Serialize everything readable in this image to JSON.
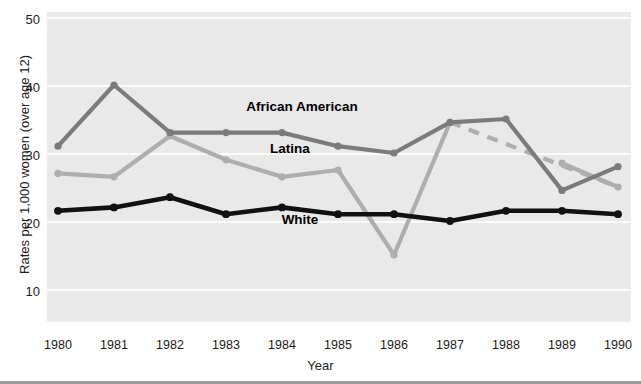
{
  "chart_data": {
    "type": "line",
    "title": "",
    "xlabel": "Year",
    "ylabel": "Rates per 1,000 women (over age 12)",
    "categories": [
      "1980",
      "1981",
      "1982",
      "1983",
      "1984",
      "1985",
      "1986",
      "1987",
      "1988",
      "1989",
      "1990"
    ],
    "x": [
      1980,
      1981,
      1982,
      1983,
      1984,
      1985,
      1986,
      1987,
      1988,
      1989,
      1990
    ],
    "ylim": [
      5,
      50
    ],
    "xlim": [
      1980,
      1990
    ],
    "y_ticks": [
      10,
      20,
      30,
      40,
      50
    ],
    "y_tick_labels": [
      "10",
      "20",
      "30",
      "40",
      "50"
    ],
    "x_ticks": [
      1980,
      1981,
      1982,
      1983,
      1984,
      1985,
      1986,
      1987,
      1988,
      1989,
      1990
    ],
    "grid": "horizontal white gridlines on gray panel",
    "legend_position": "inline labels on plot",
    "series": [
      {
        "name": "African American",
        "color": "#7b7b7b",
        "linestyle": "solid",
        "marker": "circle",
        "values": [
          31,
          40,
          33,
          33,
          33,
          31,
          30,
          34.5,
          35,
          24.5,
          28
        ]
      },
      {
        "name": "Latina",
        "color": "#aeaeae",
        "linestyle": "solid with dashed segment 1987-1990",
        "marker": "circle",
        "values": [
          27,
          26.5,
          32.5,
          29,
          26.5,
          27.5,
          15,
          34.5,
          null,
          28.5,
          25
        ],
        "dashed_segment": {
          "from_year": 1987,
          "from_value": 34.5,
          "to_year": 1990,
          "to_value": 25
        }
      },
      {
        "name": "White",
        "color": "#111111",
        "linestyle": "solid",
        "marker": "circle",
        "values": [
          21.5,
          22,
          23.5,
          21,
          22,
          21,
          21,
          20,
          21.5,
          21.5,
          21
        ]
      }
    ],
    "annotations": [
      {
        "text": "African American",
        "year": 1984,
        "value": 37.5
      },
      {
        "text": "Latina",
        "year": 1984,
        "value": 31.4
      },
      {
        "text": "White",
        "year": 1984,
        "value": 21.0
      }
    ]
  },
  "axes": {
    "y_title": "Rates per 1,000 women (over age 12)",
    "x_title": "Year",
    "y_tick_labels": [
      "50",
      "40",
      "30",
      "20",
      "10"
    ],
    "x_tick_labels": [
      "1980",
      "1981",
      "1982",
      "1983",
      "1984",
      "1985",
      "1986",
      "1987",
      "1988",
      "1989",
      "1990"
    ]
  },
  "labels": {
    "african_american": "African American",
    "latina": "Latina",
    "white": "White"
  },
  "colors": {
    "panel": "#e9e9e9",
    "gridline": "#fbfbfb",
    "african_american": "#7b7b7b",
    "latina": "#aeaeae",
    "white": "#111111",
    "text": "#1c1c1c",
    "rule": "#9a9a9a"
  }
}
